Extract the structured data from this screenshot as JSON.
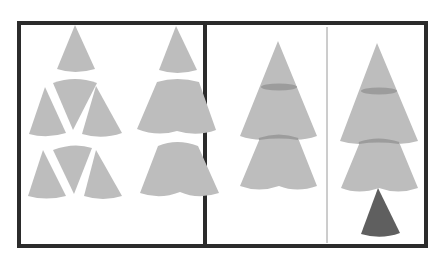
{
  "diagram": {
    "title": "",
    "colors": {
      "frame": "#2b2b2b",
      "piece": "#bdbdbd",
      "seam": "#9c9c9c",
      "trunk": "#5f5f5f",
      "divider": "#9a9a9a",
      "background": "#ffffff"
    },
    "steps": [
      {
        "id": 1,
        "label": "separate sector pieces"
      },
      {
        "id": 2,
        "label": "joined tiers"
      },
      {
        "id": 3,
        "label": "stacked tiers"
      },
      {
        "id": 4,
        "label": "tree with trunk"
      }
    ]
  }
}
